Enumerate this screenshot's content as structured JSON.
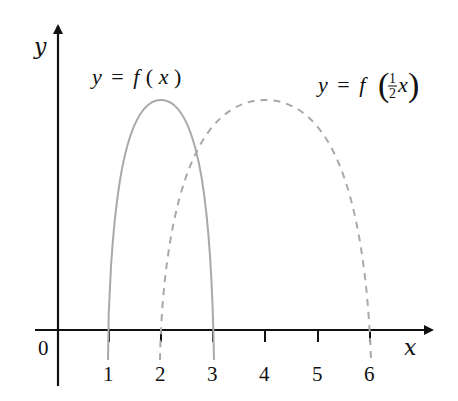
{
  "diagram": {
    "axes": {
      "x_label": "x",
      "y_label": "y",
      "origin_label": "0",
      "x_ticks": [
        "1",
        "2",
        "3",
        "4",
        "5",
        "6"
      ]
    },
    "curves": [
      {
        "name": "f",
        "label_parts": {
          "lhs": "y",
          "eq": "=",
          "fn": "f",
          "open": "(",
          "arg": "x",
          "close": ")"
        },
        "style": "solid",
        "color": "#a9a9a9",
        "roots": [
          1,
          3
        ],
        "peak_x": 2
      },
      {
        "name": "f_half",
        "label_parts": {
          "lhs": "y",
          "eq": "=",
          "fn": "f",
          "open": "(",
          "num": "1",
          "den": "2",
          "arg": "x",
          "close": ")"
        },
        "style": "dashed",
        "color": "#a9a9a9",
        "roots": [
          2,
          6
        ],
        "peak_x": 4
      }
    ],
    "colors": {
      "axis": "#111111",
      "curve": "#a9a9a9",
      "background": "#ffffff"
    }
  }
}
